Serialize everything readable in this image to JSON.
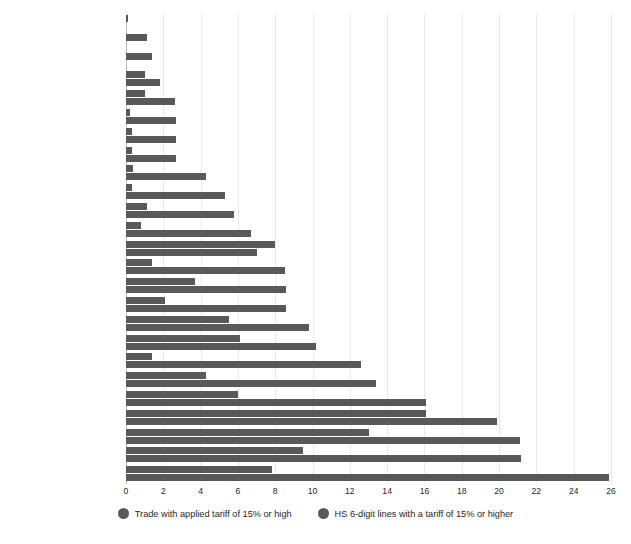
{
  "chart_data": {
    "type": "bar",
    "orientation": "horizontal",
    "title": "",
    "subtitle": "",
    "xlabel": "",
    "ylabel": "",
    "xlim": [
      0,
      26
    ],
    "xticks": [
      0,
      2,
      4,
      6,
      8,
      10,
      12,
      14,
      16,
      18,
      20,
      22,
      24,
      26
    ],
    "grid": true,
    "grid_axis": "x",
    "legend_position": "bottom",
    "categories": [
      "Oil, gas, coal",
      "Mining and metal ores",
      "Office machineries",
      "Petroleum products",
      "Machinery various",
      "Basic metals",
      "Chemicals",
      "Precision instruments",
      "Transport equipment",
      "Communication equipment",
      "Electrical machinery",
      "Paper products",
      "Tobacco, beverages",
      "Rubber/plastics",
      "Non-metallic minerals",
      "Metal products",
      "Motor vehicles",
      "Textiles",
      "Wood products",
      "Oils and fats",
      "Vegetable products",
      "Tanning",
      "Animal products",
      "Apparel",
      "Food products"
    ],
    "series": [
      {
        "name": "Trade with applied tariff of 15% or high",
        "color": "#595959",
        "values": [
          0.1,
          1.1,
          1.4,
          1.0,
          1.0,
          0.2,
          0.3,
          0.3,
          0.4,
          0.3,
          1.1,
          0.8,
          8.0,
          1.4,
          3.7,
          2.1,
          5.5,
          6.1,
          1.4,
          4.3,
          6.0,
          16.1,
          13.0,
          9.5,
          7.8
        ]
      },
      {
        "name": "HS 6-digit lines with a tariff of 15% or higher",
        "color": "#595959",
        "values": [
          0.0,
          0.0,
          0.0,
          1.8,
          2.6,
          2.7,
          2.7,
          2.7,
          4.3,
          5.3,
          5.8,
          6.7,
          7.0,
          8.5,
          8.6,
          8.6,
          9.8,
          10.2,
          12.6,
          13.4,
          16.1,
          19.9,
          21.1,
          21.2,
          25.9
        ]
      }
    ]
  },
  "legend": {
    "items": [
      {
        "label": "Trade with applied tariff of 15% or high",
        "color": "#595959"
      },
      {
        "label": "HS 6-digit lines with a tariff of 15% or higher",
        "color": "#595959"
      }
    ]
  },
  "axis": {
    "x_tick_labels": [
      "0",
      "2",
      "4",
      "6",
      "8",
      "10",
      "12",
      "14",
      "16",
      "18",
      "20",
      "22",
      "24",
      "26"
    ]
  }
}
